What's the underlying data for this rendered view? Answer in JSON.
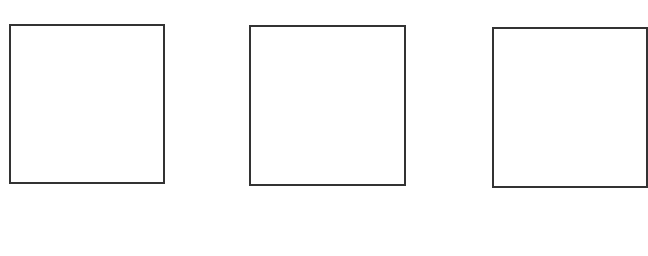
{
  "diagram": {
    "stroke_color": "#333333",
    "background": "#ffffff",
    "boxes": [
      {
        "id": "box-1",
        "x": 9,
        "y": 24,
        "w": 156,
        "h": 160
      },
      {
        "id": "box-2",
        "x": 249,
        "y": 25,
        "w": 157,
        "h": 161
      },
      {
        "id": "box-3",
        "x": 492,
        "y": 27,
        "w": 156,
        "h": 161
      }
    ]
  }
}
